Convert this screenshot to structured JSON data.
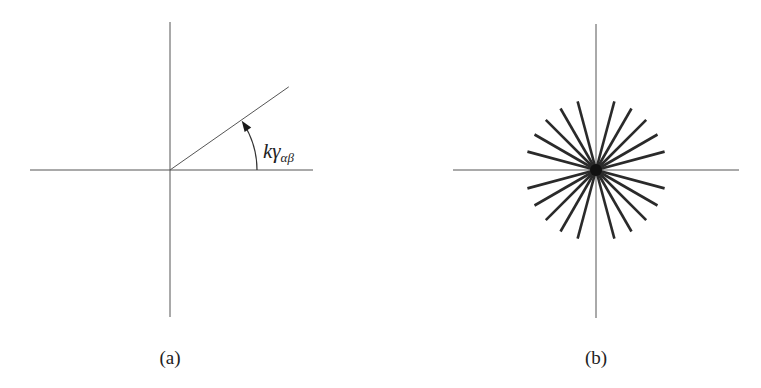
{
  "figure": {
    "panels": [
      {
        "id": "a",
        "caption": "(a)",
        "center": [
          170,
          170
        ],
        "axes": {
          "x_from": 30,
          "x_to": 313,
          "y_from": 22,
          "y_to": 317
        },
        "ray": {
          "angle_deg": 35,
          "length": 145
        },
        "angle_arc": {
          "radius": 87,
          "from_deg": 0,
          "to_deg": 35,
          "arrow": "end"
        },
        "angle_label": {
          "base": "kγ",
          "subscript": "αβ"
        }
      },
      {
        "id": "b",
        "caption": "(b)",
        "center": [
          596,
          170
        ],
        "axes": {
          "x_from": 453,
          "x_to": 739,
          "y_from": 24,
          "y_to": 318
        },
        "spokes": {
          "count": 20,
          "step_deg": 15,
          "excluded_deg": [
            0,
            90,
            180,
            270
          ],
          "radius": 71,
          "color": "#2a2a2a"
        }
      }
    ]
  }
}
